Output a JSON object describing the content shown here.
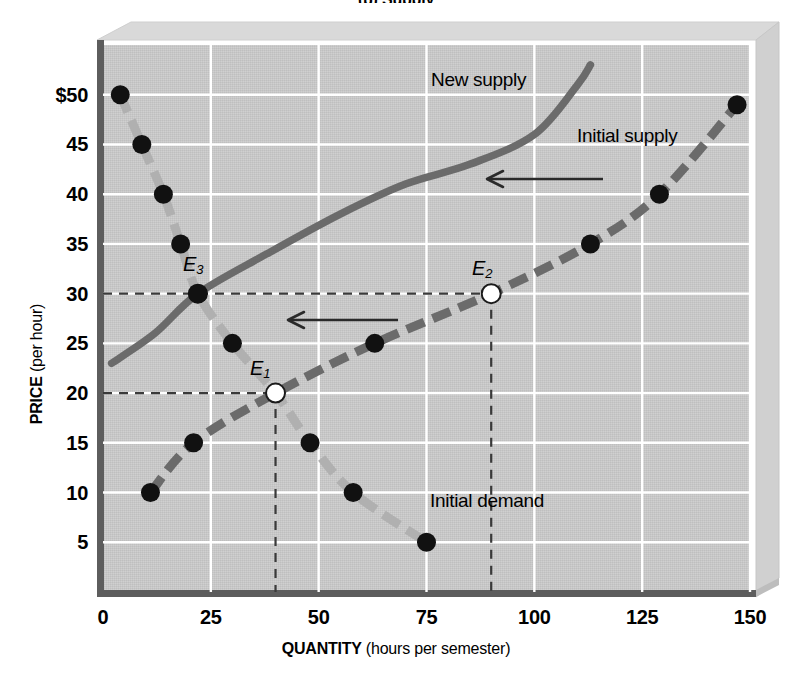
{
  "figure": {
    "title_fragment": "(b) Supply",
    "axes": {
      "y": {
        "title_bold": "PRICE",
        "title_paren": "(per hour)",
        "ticks": [
          "$50",
          "45",
          "40",
          "35",
          "30",
          "25",
          "20",
          "15",
          "10",
          "5"
        ],
        "tick_values": [
          50,
          45,
          40,
          35,
          30,
          25,
          20,
          15,
          10,
          5
        ],
        "min": 0,
        "max": 55
      },
      "x": {
        "title_bold": "QUANTITY",
        "title_paren": "(hours per semester)",
        "ticks": [
          "0",
          "25",
          "50",
          "75",
          "100",
          "125",
          "150"
        ],
        "tick_values": [
          0,
          25,
          50,
          75,
          100,
          125,
          150
        ],
        "min": 0,
        "max": 150
      }
    },
    "curve_labels": [
      {
        "name": "new-supply",
        "text": "New supply"
      },
      {
        "name": "initial-supply",
        "text": "Initial supply"
      },
      {
        "name": "initial-demand",
        "text": "Initial demand"
      }
    ],
    "equilibria": [
      {
        "name": "E1",
        "letter": "E",
        "sub": "1",
        "quantity": 40,
        "price": 20,
        "marker": "open"
      },
      {
        "name": "E2",
        "letter": "E",
        "sub": "2",
        "quantity": 90,
        "price": 30,
        "marker": "open"
      },
      {
        "name": "E3",
        "letter": "E",
        "sub": "3",
        "quantity": 22,
        "price": 30,
        "marker": "filled"
      }
    ],
    "colors": {
      "plot_background": "#cccccc",
      "gridline": "#ffffff",
      "axis": "#5d5d5d",
      "demand_curve": "#b0b0b0",
      "supply_curve": "#6b6b6b",
      "new_supply_curve": "#6b6b6b",
      "marker_fill": "#111111",
      "marker_open_fill": "#ffffff",
      "dashed_guide": "#3a3a3a",
      "arrow": "#2a2a2a",
      "box_top": "#d8d8d8",
      "box_side": "#d2d2d2"
    },
    "annotations": [
      {
        "name": "shift-arrow-upper",
        "direction": "left"
      },
      {
        "name": "shift-arrow-lower",
        "direction": "left"
      }
    ]
  },
  "chart_data": {
    "type": "line",
    "title": "(b) Supply",
    "xlabel": "QUANTITY (hours per semester)",
    "ylabel": "PRICE (per hour)",
    "xlim": [
      0,
      150
    ],
    "ylim": [
      0,
      55
    ],
    "grid": true,
    "legend": "inline-curve-labels",
    "series": [
      {
        "name": "Initial demand",
        "style": "dashed-light-gray-with-filled-dots",
        "color": "#b0b0b0",
        "points": [
          {
            "quantity": 4,
            "price": 50
          },
          {
            "quantity": 9,
            "price": 45
          },
          {
            "quantity": 14,
            "price": 40
          },
          {
            "quantity": 18,
            "price": 35
          },
          {
            "quantity": 22,
            "price": 30
          },
          {
            "quantity": 30,
            "price": 25
          },
          {
            "quantity": 40,
            "price": 20
          },
          {
            "quantity": 48,
            "price": 15
          },
          {
            "quantity": 58,
            "price": 10
          },
          {
            "quantity": 75,
            "price": 5
          }
        ]
      },
      {
        "name": "Initial supply",
        "style": "dashed-dark-gray-with-filled-dots",
        "color": "#6b6b6b",
        "points": [
          {
            "quantity": 11,
            "price": 10
          },
          {
            "quantity": 21,
            "price": 15
          },
          {
            "quantity": 40,
            "price": 20
          },
          {
            "quantity": 63,
            "price": 25
          },
          {
            "quantity": 90,
            "price": 30
          },
          {
            "quantity": 113,
            "price": 35
          },
          {
            "quantity": 129,
            "price": 40
          },
          {
            "quantity": 147,
            "price": 49
          }
        ]
      },
      {
        "name": "New supply",
        "style": "solid-dark-gray",
        "color": "#6b6b6b",
        "points": [
          {
            "quantity": 2,
            "price": 23
          },
          {
            "quantity": 12,
            "price": 26
          },
          {
            "quantity": 22,
            "price": 30
          },
          {
            "quantity": 38,
            "price": 34
          },
          {
            "quantity": 55,
            "price": 38
          },
          {
            "quantity": 70,
            "price": 41
          },
          {
            "quantity": 85,
            "price": 43
          },
          {
            "quantity": 100,
            "price": 46
          },
          {
            "quantity": 110,
            "price": 51
          },
          {
            "quantity": 113,
            "price": 53
          }
        ]
      }
    ],
    "markers": [
      {
        "label": "E1",
        "quantity": 40,
        "price": 20,
        "fill": "open"
      },
      {
        "label": "E2",
        "quantity": 90,
        "price": 30,
        "fill": "open"
      },
      {
        "label": "E3",
        "quantity": 22,
        "price": 30,
        "fill": "filled"
      }
    ],
    "guides": [
      {
        "type": "horizontal",
        "price": 20,
        "from_quantity": 0,
        "to_quantity": 40
      },
      {
        "type": "vertical",
        "quantity": 40,
        "from_price": 0,
        "to_price": 20
      },
      {
        "type": "horizontal",
        "price": 30,
        "from_quantity": 0,
        "to_quantity": 90
      },
      {
        "type": "vertical",
        "quantity": 90,
        "from_price": 0,
        "to_price": 30
      }
    ],
    "annotations": [
      {
        "text": "New supply",
        "quantity": 62,
        "price": 51
      },
      {
        "text": "Initial supply",
        "quantity": 115,
        "price": 47
      },
      {
        "text": "Initial demand",
        "quantity": 82,
        "price": 11
      }
    ]
  }
}
